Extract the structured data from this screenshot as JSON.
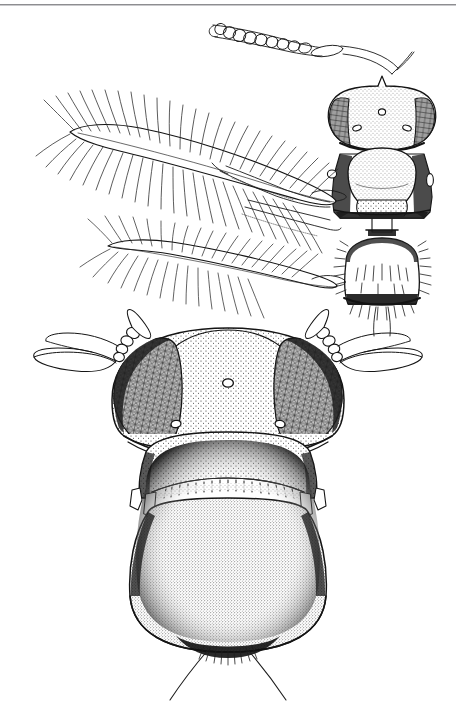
{
  "plate": {
    "background_color": "#ffffff",
    "ink_color": "#1a1a1a",
    "rule_color": "#8d8d90",
    "width": 456,
    "height": 712,
    "title": "",
    "subject": "thrips-line-drawing",
    "figure_count": 2
  },
  "figures": [
    {
      "id": "fig-upper",
      "name": "winged-adult-dorsal-partial",
      "description": "Upper figure: dorsal view of head with antenna, pair of plumose (fringed) wings, pterothorax and one abdominal segment",
      "parts": [
        {
          "name": "antenna",
          "segment_count": 11,
          "position": "upper-left-of-head"
        },
        {
          "name": "head",
          "features": [
            "compound-eye-left",
            "compound-eye-right",
            "median-ocellus",
            "ocellus-left",
            "ocellus-right"
          ]
        },
        {
          "name": "forewing",
          "type": "plumose",
          "fringe_side": "both"
        },
        {
          "name": "hindwing",
          "type": "plumose",
          "fringe_side": "both"
        },
        {
          "name": "pterothorax",
          "features": [
            "mesonotum",
            "metanotum",
            "wing-base-left",
            "wing-base-right"
          ]
        },
        {
          "name": "abdominal-segment",
          "features": [
            "marginal-setae",
            "discal-setae"
          ]
        }
      ]
    },
    {
      "id": "fig-lower",
      "name": "head-and-thorax-dorsal-enlarged",
      "description": "Lower figure: enlarged dorsal view of head, prothorax and pterothorax with antennae and terminal setae",
      "parts": [
        {
          "name": "antenna-left",
          "segment_count": 4,
          "terminal": "elongate-style"
        },
        {
          "name": "antenna-right",
          "segment_count": 4,
          "terminal": "elongate-style"
        },
        {
          "name": "compound-eye-left",
          "texture": "faceted-reticulate"
        },
        {
          "name": "compound-eye-right",
          "texture": "faceted-reticulate"
        },
        {
          "name": "median-ocellus",
          "shape": "small-oval"
        },
        {
          "name": "ocellus-left",
          "shape": "small-oval"
        },
        {
          "name": "ocellus-right",
          "shape": "small-oval"
        },
        {
          "name": "pronotum",
          "texture": "stippled"
        },
        {
          "name": "transverse-band",
          "features": [
            "tooth-like-projections"
          ]
        },
        {
          "name": "pterothorax",
          "texture": "stippled"
        },
        {
          "name": "caudal-seta-left",
          "type": "long-curved"
        },
        {
          "name": "caudal-seta-right",
          "type": "long-curved"
        }
      ]
    }
  ],
  "labels": {
    "plate_caption": "",
    "figure_upper_label": "",
    "figure_lower_label": ""
  }
}
